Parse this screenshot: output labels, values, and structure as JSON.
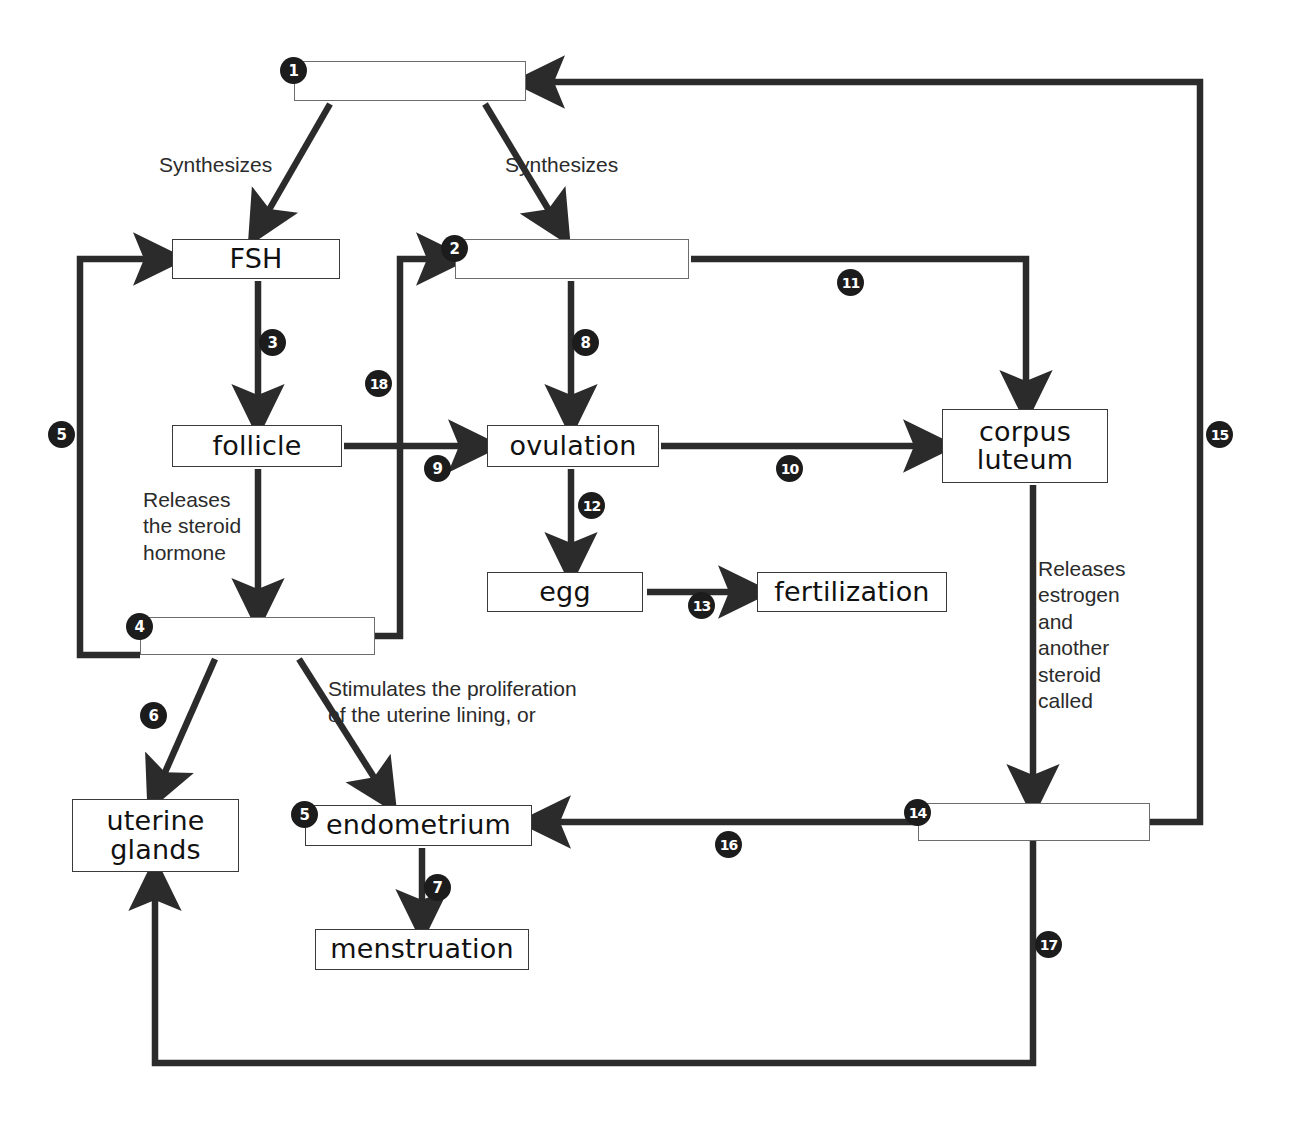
{
  "diagram": {
    "accent_color": "#1c1c1c",
    "box_border_color": "#3a3a3a",
    "background": "#ffffff"
  },
  "nodes": [
    {
      "id": "n1",
      "label": "",
      "blank": true,
      "badge": "1",
      "x": 294,
      "y": 61,
      "w": 232,
      "h": 40
    },
    {
      "id": "fsh",
      "label": "FSH",
      "blank": false,
      "badge": null,
      "x": 172,
      "y": 239,
      "w": 168,
      "h": 40
    },
    {
      "id": "n2",
      "label": "",
      "blank": true,
      "badge": "2",
      "x": 455,
      "y": 239,
      "w": 234,
      "h": 40
    },
    {
      "id": "follicle",
      "label": "follicle",
      "blank": false,
      "badge": null,
      "x": 172,
      "y": 425,
      "w": 170,
      "h": 42
    },
    {
      "id": "ovulation",
      "label": "ovulation",
      "blank": false,
      "badge": null,
      "x": 487,
      "y": 425,
      "w": 172,
      "h": 42
    },
    {
      "id": "corpus",
      "label": "corpus\nluteum",
      "blank": false,
      "badge": null,
      "x": 942,
      "y": 409,
      "w": 166,
      "h": 74
    },
    {
      "id": "n4",
      "label": "",
      "blank": true,
      "badge": "4",
      "x": 140,
      "y": 617,
      "w": 235,
      "h": 38
    },
    {
      "id": "egg",
      "label": "egg",
      "blank": false,
      "badge": null,
      "x": 487,
      "y": 572,
      "w": 156,
      "h": 40
    },
    {
      "id": "fertilization",
      "label": "fertilization",
      "blank": false,
      "badge": null,
      "x": 757,
      "y": 572,
      "w": 190,
      "h": 40
    },
    {
      "id": "uterine",
      "label": "uterine\nglands",
      "blank": false,
      "badge": null,
      "x": 72,
      "y": 799,
      "w": 167,
      "h": 73
    },
    {
      "id": "endometrium",
      "label": "endometrium",
      "blank": false,
      "badge": "5",
      "x": 305,
      "y": 805,
      "w": 227,
      "h": 41
    },
    {
      "id": "n14",
      "label": "",
      "blank": true,
      "badge": "14",
      "x": 918,
      "y": 803,
      "w": 232,
      "h": 38
    },
    {
      "id": "menstruation",
      "label": "menstruation",
      "blank": false,
      "badge": null,
      "x": 315,
      "y": 929,
      "w": 214,
      "h": 41
    }
  ],
  "notes": [
    {
      "id": "note-syn-left",
      "text": "Synthesizes",
      "x": 159,
      "y": 152,
      "w": 180
    },
    {
      "id": "note-syn-right",
      "text": "Synthesizes",
      "x": 505,
      "y": 152,
      "w": 180
    },
    {
      "id": "note-releases-steroid",
      "text": "Releases\nthe steroid\nhormone",
      "x": 143,
      "y": 487,
      "w": 170
    },
    {
      "id": "note-stimulates",
      "text": "Stimulates the proliferation\nof the uterine lining, or",
      "x": 328,
      "y": 676,
      "w": 400
    },
    {
      "id": "note-releases-estrogen",
      "text": "Releases\nestrogen\nand\nanother\nsteroid\ncalled",
      "x": 1038,
      "y": 556,
      "w": 150
    }
  ],
  "badges": [
    {
      "n": "3",
      "x": 259,
      "y": 329
    },
    {
      "n": "8",
      "x": 572,
      "y": 329
    },
    {
      "n": "11",
      "x": 837,
      "y": 269
    },
    {
      "n": "18",
      "x": 365,
      "y": 370
    },
    {
      "n": "5",
      "x": 48,
      "y": 421
    },
    {
      "n": "15",
      "x": 1206,
      "y": 421
    },
    {
      "n": "9",
      "x": 424,
      "y": 455
    },
    {
      "n": "10",
      "x": 776,
      "y": 455
    },
    {
      "n": "12",
      "x": 578,
      "y": 492
    },
    {
      "n": "13",
      "x": 688,
      "y": 592
    },
    {
      "n": "6",
      "x": 140,
      "y": 702
    },
    {
      "n": "16",
      "x": 715,
      "y": 831
    },
    {
      "n": "7",
      "x": 424,
      "y": 874
    },
    {
      "n": "17",
      "x": 1035,
      "y": 931
    }
  ],
  "connectors": [
    {
      "id": "c1-fsh",
      "from": "n1",
      "to": "fsh",
      "label": "Synthesizes"
    },
    {
      "id": "c1-n2",
      "from": "n1",
      "to": "n2",
      "label": "Synthesizes"
    },
    {
      "id": "c-fsh-follicle",
      "from": "fsh",
      "to": "follicle",
      "label": "3"
    },
    {
      "id": "c-n2-ovulation",
      "from": "n2",
      "to": "ovulation",
      "label": "8"
    },
    {
      "id": "c-n2-corpus",
      "from": "n2",
      "to": "corpus",
      "label": "11"
    },
    {
      "id": "c-follicle-n4",
      "from": "follicle",
      "to": "n4",
      "label": "Releases the steroid hormone"
    },
    {
      "id": "c-follicle-ovul",
      "from": "follicle",
      "to": "ovulation",
      "label": "9"
    },
    {
      "id": "c-ovul-corpus",
      "from": "ovulation",
      "to": "corpus",
      "label": "10"
    },
    {
      "id": "c-ovul-egg",
      "from": "ovulation",
      "to": "egg",
      "label": "12"
    },
    {
      "id": "c-egg-fert",
      "from": "egg",
      "to": "fertilization",
      "label": "13"
    },
    {
      "id": "c-n4-fsh",
      "from": "n4",
      "to": "fsh",
      "label": "5"
    },
    {
      "id": "c-n4-n2",
      "from": "n4",
      "to": "n2",
      "label": "18"
    },
    {
      "id": "c-n4-uterine",
      "from": "n4",
      "to": "uterine",
      "label": "6"
    },
    {
      "id": "c-n4-endometrium",
      "from": "n4",
      "to": "endometrium",
      "label": "Stimulates the proliferation of the uterine lining, or"
    },
    {
      "id": "c-endo-menstr",
      "from": "endometrium",
      "to": "menstruation",
      "label": "7"
    },
    {
      "id": "c-corpus-n14",
      "from": "corpus",
      "to": "n14",
      "label": "Releases estrogen and another steroid called"
    },
    {
      "id": "c-n14-endo",
      "from": "n14",
      "to": "endometrium",
      "label": "16"
    },
    {
      "id": "c-n14-n1",
      "from": "n14",
      "to": "n1",
      "label": "15"
    },
    {
      "id": "c-n14-uterine",
      "from": "n14",
      "to": "uterine",
      "label": "17"
    }
  ]
}
